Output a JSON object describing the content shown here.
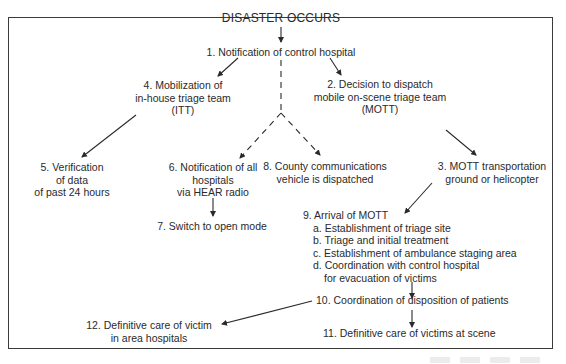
{
  "diagram": {
    "title": "DISASTER OCCURS",
    "nodes": [
      {
        "id": "1",
        "lines": [
          "1. Notification of control hospital"
        ]
      },
      {
        "id": "2",
        "lines": [
          "2. Decision to dispatch",
          "mobile on-scene triage team",
          "(MOTT)"
        ]
      },
      {
        "id": "3",
        "lines": [
          "3. MOTT transportation",
          "ground or helicopter"
        ]
      },
      {
        "id": "4",
        "lines": [
          "4. Mobilization of",
          "in-house triage team",
          "(ITT)"
        ]
      },
      {
        "id": "5",
        "lines": [
          "5. Verification",
          "of data",
          "of past 24 hours"
        ]
      },
      {
        "id": "6",
        "lines": [
          "6. Notification of all",
          "hospitals",
          "via HEAR radio"
        ]
      },
      {
        "id": "7",
        "lines": [
          "7. Switch to open mode"
        ]
      },
      {
        "id": "8",
        "lines": [
          "8. County communications",
          "vehicle is dispatched"
        ]
      },
      {
        "id": "9",
        "lines": [
          "9. Arrival of MOTT"
        ],
        "subitems": [
          "a. Establishment of triage site",
          "b. Triage and initial treatment",
          "c. Establishment of ambulance staging area",
          "d. Coordination with control hospital",
          "for evacuation of victims"
        ]
      },
      {
        "id": "10",
        "lines": [
          "10. Coordination of disposition of patients"
        ]
      },
      {
        "id": "11",
        "lines": [
          "11. Definitive care of victims at scene"
        ]
      },
      {
        "id": "12",
        "lines": [
          "12. Definitive care of victim",
          "in area hospitals"
        ]
      }
    ],
    "edges": [
      {
        "from": "title",
        "to": "1",
        "style": "solid"
      },
      {
        "from": "1",
        "to": "4",
        "style": "solid"
      },
      {
        "from": "1",
        "to": "2",
        "style": "solid"
      },
      {
        "from": "1",
        "to": "6",
        "style": "dashed"
      },
      {
        "from": "1",
        "to": "8",
        "style": "dashed"
      },
      {
        "from": "4",
        "to": "5",
        "style": "solid"
      },
      {
        "from": "2",
        "to": "3",
        "style": "solid"
      },
      {
        "from": "3",
        "to": "9",
        "style": "solid"
      },
      {
        "from": "6",
        "to": "7",
        "style": "solid"
      },
      {
        "from": "9",
        "to": "10",
        "style": "solid"
      },
      {
        "from": "10",
        "to": "11",
        "style": "solid"
      },
      {
        "from": "10",
        "to": "12",
        "style": "solid"
      }
    ],
    "colors": {
      "line": "#2a2a2a",
      "text": "#2a2a2a",
      "background": "#ffffff"
    }
  }
}
